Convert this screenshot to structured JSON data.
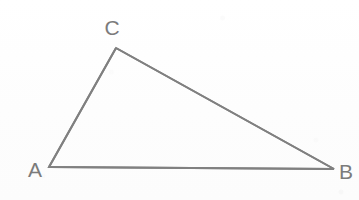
{
  "figure": {
    "type": "geometry-diagram",
    "shape_name": "triangle",
    "background_color": "#fdfdfd",
    "stroke_color": "#808080",
    "label_color": "#7b7b7b",
    "stroke_width": 2,
    "canvas": {
      "width": 359,
      "height": 200
    },
    "vertices": [
      {
        "id": "A",
        "label": "A",
        "x": 49,
        "y": 167,
        "label_x": 35,
        "label_y": 169
      },
      {
        "id": "B",
        "label": "B",
        "x": 334,
        "y": 169,
        "label_x": 346,
        "label_y": 171
      },
      {
        "id": "C",
        "label": "C",
        "x": 116,
        "y": 48,
        "label_x": 112,
        "label_y": 27
      }
    ],
    "edges": [
      {
        "id": "AB",
        "from": "A",
        "to": "B"
      },
      {
        "id": "BC",
        "from": "B",
        "to": "C"
      },
      {
        "id": "CA",
        "from": "C",
        "to": "A"
      }
    ],
    "path": "M 49 167 L 116 48 L 334 169 Z"
  }
}
